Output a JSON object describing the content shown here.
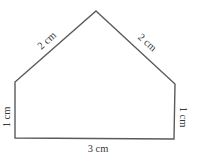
{
  "diagram": {
    "type": "pentagon-house-shape",
    "stroke_color": "#5a5a5a",
    "label_color": "#3a3a3a",
    "vertices": {
      "apex": [
        96,
        11
      ],
      "left_shoulder": [
        15,
        82
      ],
      "right_shoulder": [
        175,
        84
      ],
      "bottom_right": [
        174,
        139
      ],
      "bottom_left": [
        15,
        138
      ]
    },
    "labels": {
      "top_left_side": "2 cm",
      "top_right_side": "2 cm",
      "left_side": "1 cm",
      "right_side": "1 cm",
      "bottom_side": "3 cm"
    }
  }
}
